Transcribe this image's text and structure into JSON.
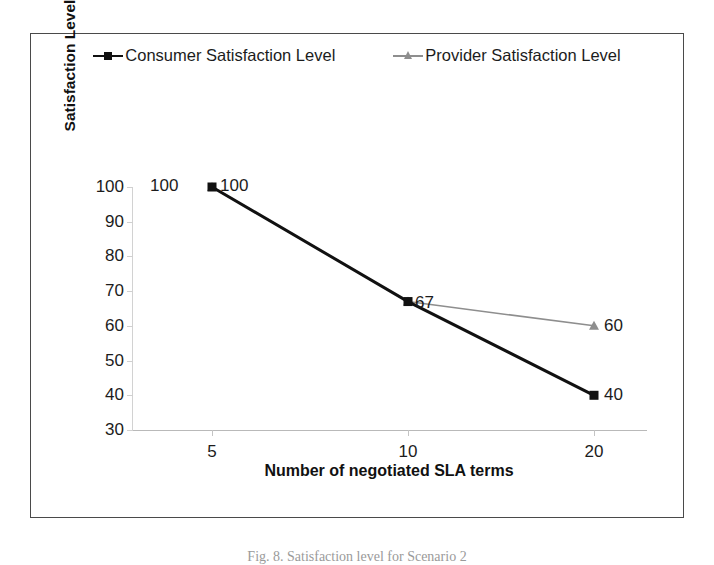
{
  "figure": {
    "caption": "Fig. 8. Satisfaction level for Scenario 2"
  },
  "legend": {
    "position": "top-center",
    "entries": [
      {
        "label": "Consumer Satisfaction Level",
        "marker": "square-marker-icon",
        "color": "#111111"
      },
      {
        "label": "Provider Satisfaction Level",
        "marker": "triangle-marker-icon",
        "color": "#8e8e8e"
      }
    ]
  },
  "axes": {
    "x_title": "Number of negotiated SLA terms",
    "y_title": "Satisfaction Level",
    "x_ticks": [
      "5",
      "10",
      "20"
    ],
    "y_ticks": [
      "100",
      "90",
      "80",
      "70",
      "60",
      "50",
      "40",
      "30"
    ]
  },
  "chart_data": {
    "type": "line",
    "title": "",
    "xlabel": "Number of negotiated SLA terms",
    "ylabel": "Satisfaction Level",
    "categories": [
      "5",
      "10",
      "20"
    ],
    "x": [
      5,
      10,
      20
    ],
    "ylim": [
      30,
      100
    ],
    "ytick_step": 10,
    "grid": false,
    "legend_position": "top-center",
    "series": [
      {
        "name": "Consumer Satisfaction Level",
        "values": [
          100,
          67,
          40
        ],
        "color": "#111111",
        "marker": "square",
        "line_width": 3,
        "data_labels": [
          "100",
          "67",
          "40"
        ]
      },
      {
        "name": "Provider Satisfaction Level",
        "values": [
          100,
          67,
          60
        ],
        "color": "#8e8e8e",
        "marker": "triangle",
        "line_width": 1.5,
        "data_labels": [
          "100",
          "67",
          "60"
        ]
      }
    ]
  },
  "annotations": {
    "left_100": "100"
  }
}
